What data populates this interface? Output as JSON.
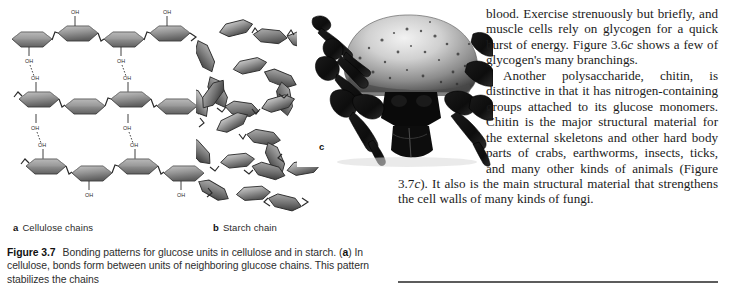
{
  "page": {
    "background_color": "#ffffff",
    "width": 738,
    "height": 292
  },
  "panels": [
    {
      "letter": "a",
      "label": "Cellulose chains",
      "icon": "cellulose-chains-diagram",
      "description": "Four parallel chains of hexagonal glucose rings linked by zigzag bonds, with OH groups and dashed hydrogen bonds between neighboring chains"
    },
    {
      "letter": "b",
      "label": "Starch chain",
      "icon": "starch-coil-diagram",
      "description": "A single chain of hexagonal glucose rings coiled into a helix"
    },
    {
      "letter": "c",
      "label": "",
      "icon": "tick-photograph",
      "description": "Black and white photograph of a tick, an animal with a chitin exoskeleton"
    }
  ],
  "diagram": {
    "oh_label": "OH",
    "ring_fill_dark": "#6e6e6e",
    "ring_fill_light": "#c8c8c8",
    "bond_color": "#2a2a2a"
  },
  "caption": {
    "figure_number": "Figure 3.7",
    "line_1": "Bonding patterns for glucose units in cellulose",
    "line_2_pre": "and in starch. (",
    "line_2_bold": "a",
    "line_2_post": ") In cellulose, bonds form between units of",
    "line_3": "neighboring glucose chains. This pattern stabilizes the chains"
  },
  "body": {
    "paragraph_1": "blood. Exercise strenuously but briefly, and muscle cells rely on glycogen for a quick burst of energy. Figure 3.6",
    "paragraph_1_italic": "c",
    "paragraph_1_tail": " shows a few of glycogen's many branchings.",
    "paragraph_2_pre": "Another polysaccharide, chitin, is distinctive in that it has nitrogen-containing groups attached to its glucose monomers. Chitin is the major structural material for the external skeletons and other hard body parts of crabs, earthworms, insects, ticks, and many other kinds of animals (Figure 3.7",
    "paragraph_2_italic": "c",
    "paragraph_2_post": "). It also is the main structural material that strengthens the cell walls of many kinds of fungi."
  },
  "rule": {
    "color": "#5c5c5c",
    "name": "section-divider"
  }
}
